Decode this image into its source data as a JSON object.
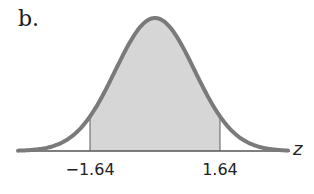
{
  "panel_label": "b.",
  "chart_data": {
    "type": "area",
    "title": "",
    "distribution": "standard normal",
    "xlabel": "z",
    "ylabel": "",
    "x_range": [
      -3.5,
      3.5
    ],
    "shaded_region": {
      "from": -1.64,
      "to": 1.64
    },
    "tick_labels": [
      "−1.64",
      "1.64"
    ],
    "tick_values": [
      -1.64,
      1.64
    ],
    "grid": false,
    "legend": null,
    "colors": {
      "curve": "#7a7a7a",
      "shade": "#d6d6d6",
      "axis": "#555555",
      "boundary": "#8a8a8a"
    }
  }
}
